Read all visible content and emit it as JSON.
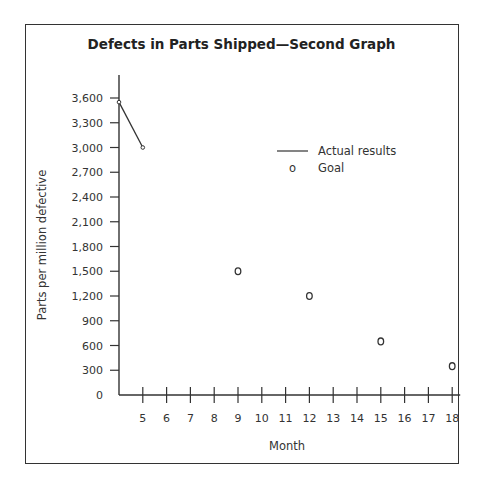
{
  "chart_data": {
    "type": "line",
    "title": "Defects in Parts Shipped—Second Graph",
    "xlabel": "Month",
    "ylabel": "Parts per million defective",
    "x_ticks": [
      5,
      6,
      7,
      8,
      9,
      10,
      11,
      12,
      13,
      14,
      15,
      16,
      17,
      18
    ],
    "y_ticks": [
      0,
      300,
      600,
      900,
      1200,
      1500,
      1800,
      2100,
      2400,
      2700,
      3000,
      3300,
      3600
    ],
    "y_tick_labels": [
      "0",
      "300",
      "600",
      "900",
      "1,200",
      "1,500",
      "1,800",
      "2,100",
      "2,400",
      "2,700",
      "3,000",
      "3,300",
      "3,600"
    ],
    "xlim": [
      4,
      18
    ],
    "ylim": [
      0,
      3600
    ],
    "grid": false,
    "legend_position": "upper right",
    "series": [
      {
        "name": "Actual results",
        "style": "line",
        "x": [
          4,
          5
        ],
        "values": [
          3550,
          3000
        ]
      },
      {
        "name": "Goal",
        "style": "marker-circle",
        "x": [
          9,
          12,
          15,
          18
        ],
        "values": [
          1500,
          1200,
          650,
          350
        ]
      }
    ]
  },
  "legend": {
    "actual_label": "Actual results",
    "goal_label": "Goal",
    "goal_marker": "o"
  }
}
